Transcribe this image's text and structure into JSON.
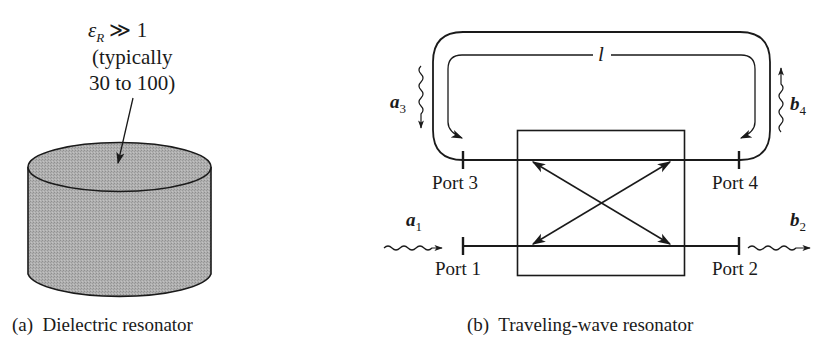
{
  "panel_a": {
    "annotation": {
      "symbol": "ε",
      "subscript": "R",
      "relation": "≫ 1",
      "line2": "(typically",
      "line3": "30 to 100)"
    },
    "shape": "cylinder",
    "fill_color": "#a9a9a9",
    "caption": "(a)  Dielectric resonator"
  },
  "panel_b": {
    "loop_length_label": "l",
    "ports": [
      {
        "name": "Port 1",
        "wave_label": "a",
        "wave_sub": "1",
        "direction": "in"
      },
      {
        "name": "Port 2",
        "wave_label": "b",
        "wave_sub": "2",
        "direction": "out"
      },
      {
        "name": "Port 3",
        "wave_label": "a",
        "wave_sub": "3",
        "direction": "in"
      },
      {
        "name": "Port 4",
        "wave_label": "b",
        "wave_sub": "4",
        "direction": "out"
      }
    ],
    "caption": "(b)  Traveling-wave resonator"
  }
}
